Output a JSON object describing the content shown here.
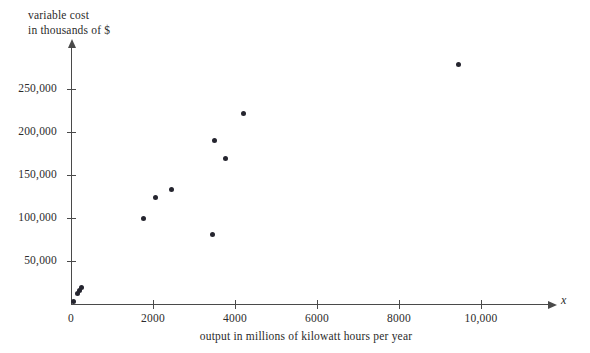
{
  "chart_data": {
    "type": "scatter",
    "title": "",
    "xlabel": "output in millions of kilowatt hours per year",
    "ylabel_line1": "variable cost",
    "ylabel_line2": "in thousands of $",
    "x_axis_variable": "x",
    "grid": false,
    "legend": null,
    "xlim": [
      0,
      11600
    ],
    "ylim": [
      0,
      303000
    ],
    "xticks": [
      0,
      2000,
      4000,
      6000,
      8000,
      10000
    ],
    "xtick_labels": [
      "0",
      "2000",
      "4000",
      "6000",
      "8000",
      "10,000"
    ],
    "yticks": [
      50000,
      100000,
      150000,
      200000,
      250000
    ],
    "ytick_labels": [
      "50,000",
      "100,000",
      "150,000",
      "200,000",
      "250,000"
    ],
    "marker_color": "#25252f",
    "axis_color": "#4a4a4a",
    "points": [
      {
        "x": 60,
        "y": 3000
      },
      {
        "x": 150,
        "y": 12000
      },
      {
        "x": 210,
        "y": 16000
      },
      {
        "x": 260,
        "y": 19000
      },
      {
        "x": 1760,
        "y": 99000
      },
      {
        "x": 2050,
        "y": 124000
      },
      {
        "x": 2460,
        "y": 133000
      },
      {
        "x": 3440,
        "y": 81000
      },
      {
        "x": 3490,
        "y": 190000
      },
      {
        "x": 3760,
        "y": 169000
      },
      {
        "x": 4200,
        "y": 221000
      },
      {
        "x": 9440,
        "y": 278000
      }
    ]
  }
}
